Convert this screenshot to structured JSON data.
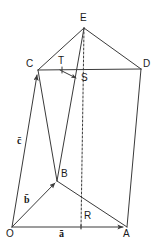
{
  "figure": {
    "background_color": "#ffffff",
    "line_color": "#3a3a3a",
    "text_color": "#1a1a1a",
    "width": 164,
    "height": 246
  },
  "vertices": [
    {
      "id": "O",
      "label": "O",
      "x": 12,
      "y": 227,
      "label_x": 7,
      "label_y": 230
    },
    {
      "id": "A",
      "label": "A",
      "x": 127,
      "y": 227,
      "label_x": 124,
      "label_y": 230
    },
    {
      "id": "B",
      "label": "B",
      "x": 57,
      "y": 181,
      "label_x": 61,
      "label_y": 170
    },
    {
      "id": "C",
      "label": "C",
      "x": 38,
      "y": 70,
      "label_x": 27,
      "label_y": 60
    },
    {
      "id": "D",
      "label": "D",
      "x": 141,
      "y": 69,
      "label_x": 144,
      "label_y": 60
    },
    {
      "id": "E",
      "label": "E",
      "x": 84,
      "y": 28,
      "label_x": 81,
      "label_y": 14
    },
    {
      "id": "R",
      "label": "R",
      "x": 81,
      "y": 227,
      "label_x": 84,
      "label_y": 212
    },
    {
      "id": "S",
      "label": "S",
      "x": 77,
      "y": 77,
      "label_x": 82,
      "label_y": 74
    },
    {
      "id": "T",
      "label": "T",
      "x": 62,
      "y": 70,
      "label_x": 59,
      "label_y": 57
    }
  ],
  "vector_labels": [
    {
      "id": "a",
      "label": "ā",
      "x": 60,
      "y": 229,
      "from": "O",
      "to": "A"
    },
    {
      "id": "b",
      "label": "b̄",
      "x": 25,
      "y": 196,
      "from": "O",
      "to": "B"
    },
    {
      "id": "c",
      "label": "c̄",
      "x": 18,
      "y": 137,
      "from": "O",
      "to": "C"
    }
  ],
  "edges": [
    {
      "name": "O-A",
      "from": "O",
      "to": "A",
      "style": "solid",
      "arrow": true
    },
    {
      "name": "O-B",
      "from": "O",
      "to": "B",
      "style": "solid",
      "arrow": true
    },
    {
      "name": "O-C",
      "from": "O",
      "to": "C",
      "style": "solid",
      "arrow": true
    },
    {
      "name": "B-A",
      "from": "B",
      "to": "A",
      "style": "solid",
      "arrow": false
    },
    {
      "name": "A-D",
      "from": "A",
      "to": "D",
      "style": "solid",
      "arrow": false
    },
    {
      "name": "C-D",
      "from": "C",
      "to": "D",
      "style": "solid",
      "arrow": false
    },
    {
      "name": "C-E",
      "from": "C",
      "to": "E",
      "style": "solid",
      "arrow": false
    },
    {
      "name": "D-E",
      "from": "D",
      "to": "E",
      "style": "solid",
      "arrow": false
    },
    {
      "name": "B-E",
      "from": "B",
      "to": "E",
      "style": "solid",
      "arrow": false
    },
    {
      "name": "B-C",
      "from": "B",
      "to": "C",
      "style": "solid",
      "arrow": false
    },
    {
      "name": "E-R",
      "from": "E",
      "to": "R",
      "style": "dashed",
      "arrow": false
    },
    {
      "name": "T-S",
      "from": "T",
      "to": "S",
      "style": "solid",
      "arrow": true
    }
  ],
  "markers": {
    "dashed_dasharray": "2,2",
    "stroke_width": 1
  }
}
